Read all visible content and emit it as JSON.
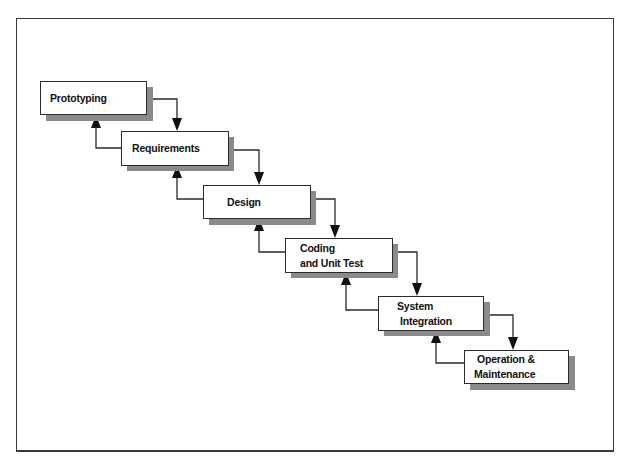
{
  "figure": {
    "colors": {
      "border": "#2a2a2a",
      "shadow": "#8a8a8a",
      "background": "#ffffff",
      "line": "#2a2a2a"
    },
    "stages": [
      {
        "id": "prototyping",
        "lines": [
          "Prototyping"
        ]
      },
      {
        "id": "requirements",
        "lines": [
          "Requirements"
        ]
      },
      {
        "id": "design",
        "lines": [
          "Design"
        ]
      },
      {
        "id": "coding",
        "lines": [
          "Coding",
          "and Unit Test"
        ]
      },
      {
        "id": "system-integration",
        "lines": [
          "System",
          "Integration"
        ]
      },
      {
        "id": "operation",
        "lines": [
          "Operation &",
          "Maintenance"
        ]
      }
    ],
    "flow": {
      "forward": [
        [
          "Prototyping",
          "Requirements"
        ],
        [
          "Requirements",
          "Design"
        ],
        [
          "Design",
          "Coding and Unit Test"
        ],
        [
          "Coding and Unit Test",
          "System Integration"
        ],
        [
          "System Integration",
          "Operation & Maintenance"
        ]
      ],
      "feedback": [
        [
          "Requirements",
          "Prototyping"
        ],
        [
          "Design",
          "Requirements"
        ],
        [
          "Coding and Unit Test",
          "Design"
        ],
        [
          "System Integration",
          "Coding and Unit Test"
        ],
        [
          "Operation & Maintenance",
          "System Integration"
        ]
      ]
    }
  }
}
